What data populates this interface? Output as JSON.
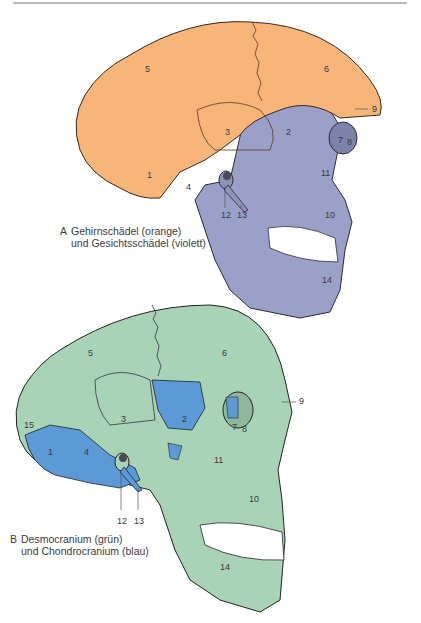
{
  "figure_a": {
    "letter": "A",
    "caption_line1": "Gehirnschädel (orange)",
    "caption_line2": "und Gesichtsschädel (violett)",
    "colors": {
      "neurocranium": "#f8b57a",
      "viscerocranium": "#9aa0c8",
      "outline": "#3a2a20"
    },
    "labels": [
      "1",
      "2",
      "3",
      "4",
      "5",
      "6",
      "7",
      "8",
      "9",
      "10",
      "11",
      "12",
      "13",
      "14"
    ]
  },
  "figure_b": {
    "letter": "B",
    "caption_line1": "Desmocranium (grün)",
    "caption_line2": "und Chondrocranium (blau)",
    "colors": {
      "desmocranium": "#a9d3b7",
      "chondrocranium": "#5b9ad6",
      "outline": "#222222"
    },
    "labels": [
      "1",
      "2",
      "3",
      "4",
      "5",
      "6",
      "7",
      "8",
      "9",
      "10",
      "11",
      "12",
      "13",
      "14",
      "15"
    ]
  }
}
